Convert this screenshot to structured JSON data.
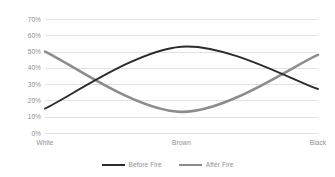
{
  "chart_data": {
    "type": "line",
    "title": "",
    "xlabel": "",
    "ylabel": "",
    "categories": [
      "White",
      "Brown",
      "Black"
    ],
    "series": [
      {
        "name": "Before Fire",
        "values": [
          0.15,
          0.53,
          0.27
        ],
        "color": "#2b2b2b"
      },
      {
        "name": "After Fire",
        "values": [
          0.5,
          0.13,
          0.48
        ],
        "color": "#8c8c8c"
      }
    ],
    "ylim": [
      0,
      0.7
    ],
    "y_ticks": [
      0,
      0.1,
      0.2,
      0.3,
      0.4,
      0.5,
      0.6,
      0.7
    ],
    "y_tick_labels": [
      "0%",
      "10%",
      "20%",
      "30%",
      "40%",
      "50%",
      "60%",
      "70%"
    ],
    "grid": true,
    "smoothed": true,
    "legend_position": "bottom"
  },
  "axes": {
    "y_tick_labels": [
      "70%",
      "60%",
      "50%",
      "40%",
      "30%",
      "20%",
      "10%",
      "0%"
    ],
    "x_tick_labels": [
      "White",
      "Brown",
      "Black"
    ]
  },
  "legend": {
    "entries": [
      {
        "label": "Before Fire",
        "color": "#2b2b2b"
      },
      {
        "label": "After Fire",
        "color": "#8c8c8c"
      }
    ]
  },
  "style": {
    "background": "#ffffff",
    "gridline_color": "#e2e2e2",
    "text_color": "#8f8f8f"
  }
}
